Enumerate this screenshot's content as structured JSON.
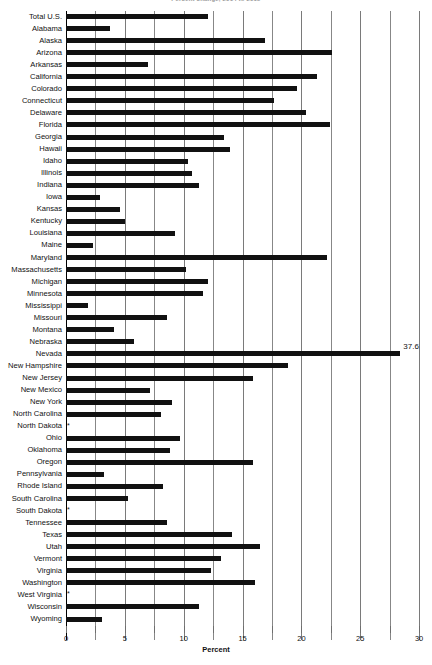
{
  "chart_data": {
    "type": "bar",
    "orientation": "horizontal",
    "title": "Percent change, 2014 to 2015",
    "xlabel": "Percent",
    "ylabel": "",
    "xlim": [
      0,
      30
    ],
    "xticks": [
      0,
      5,
      10,
      15,
      20,
      25,
      30
    ],
    "xtick_labels": [
      "0",
      "5",
      "10",
      "15",
      "20",
      "25",
      "30"
    ],
    "minor_tick_step": 2.5,
    "grid": true,
    "grid_axis": "x",
    "legend": "none",
    "bar_color": "#111111",
    "suppressed_marker": "*",
    "categories": [
      "Total U.S.",
      "Alabama",
      "Alaska",
      "Arizona",
      "Arkansas",
      "California",
      "Colorado",
      "Connecticut",
      "Delaware",
      "Florida",
      "Georgia",
      "Hawaii",
      "Idaho",
      "Illinois",
      "Indiana",
      "Iowa",
      "Kansas",
      "Kentucky",
      "Louisiana",
      "Maine",
      "Maryland",
      "Massachusetts",
      "Michigan",
      "Minnesota",
      "Mississippi",
      "Missouri",
      "Montana",
      "Nebraska",
      "Nevada",
      "New Hampshire",
      "New Jersey",
      "New Mexico",
      "New York",
      "North Carolina",
      "North Dakota",
      "Ohio",
      "Oklahoma",
      "Oregon",
      "Pennsylvania",
      "Rhode Island",
      "South Carolina",
      "South Dakota",
      "Tennessee",
      "Texas",
      "Utah",
      "Vermont",
      "Virginia",
      "Washington",
      "West Virginia",
      "Wisconsin",
      "Wyoming"
    ],
    "values": [
      12.1,
      3.7,
      16.9,
      22.6,
      7.0,
      21.3,
      19.6,
      17.7,
      20.4,
      22.4,
      13.4,
      13.9,
      10.4,
      10.7,
      11.3,
      2.9,
      4.6,
      5.0,
      9.3,
      2.3,
      22.2,
      10.2,
      12.1,
      11.6,
      1.9,
      8.6,
      4.1,
      5.8,
      37.6,
      18.9,
      15.9,
      7.1,
      9.0,
      8.1,
      null,
      9.7,
      8.8,
      15.9,
      3.2,
      8.2,
      5.3,
      null,
      8.6,
      14.1,
      16.5,
      13.2,
      12.3,
      16.1,
      null,
      11.3,
      3.1
    ],
    "data_labels": {
      "Nevada": "37.6"
    }
  }
}
